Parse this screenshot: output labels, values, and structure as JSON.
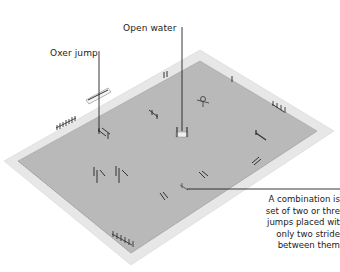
{
  "figure": {
    "colors": {
      "background": "#ffffff",
      "arena_border": "#e6e6e6",
      "arena_surface": "#b9b9b9",
      "jump_dark": "#333333",
      "jump_light": "#f0f0f0",
      "callout_line": "#222222"
    }
  },
  "labels": {
    "open_water": "Open water",
    "oxer_jump": "Oxer jump",
    "combination_lines": [
      "A combination is",
      "set of two or thre",
      "jumps placed wit",
      "only two stride",
      "between them"
    ]
  }
}
